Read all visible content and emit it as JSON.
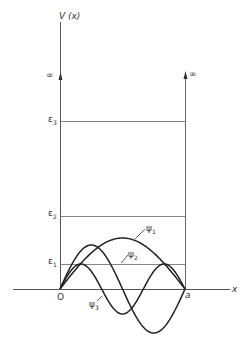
{
  "diagram": {
    "y_axis_label": "V (x)",
    "x_axis_label": "x",
    "origin_label": "O",
    "right_wall_label": "a",
    "infinity_left": "∞",
    "infinity_right": "∞",
    "energy_levels": [
      {
        "label": "ε",
        "sub": "1",
        "y": 264
      },
      {
        "label": "ε",
        "sub": "2",
        "y": 216
      },
      {
        "label": "ε",
        "sub": "3",
        "y": 121
      }
    ],
    "wavefunctions": [
      {
        "label": "ψ",
        "sub": "1",
        "n": 1,
        "amplitude": 51
      },
      {
        "label": "ψ",
        "sub": "2",
        "n": 2,
        "amplitude": 44
      },
      {
        "label": "ψ",
        "sub": "3",
        "n": 3,
        "amplitude": 25
      }
    ],
    "geometry": {
      "x0": 60,
      "xa": 185,
      "baseline": 289,
      "axis_top": 22,
      "axis_left": 13,
      "axis_right": 230,
      "arrow_y": 74
    },
    "colors": {
      "curve": "#222222",
      "axis": "#555555",
      "level": "#777777"
    }
  }
}
